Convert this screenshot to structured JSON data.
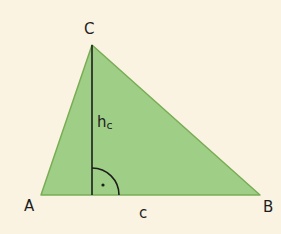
{
  "colors": {
    "background": "#fbf3e2",
    "triangle_fill": "#9fcf86",
    "triangle_stroke": "#79ad55",
    "line": "#1e1e1e"
  },
  "vertices": {
    "A": {
      "label": "A",
      "x": 41,
      "y": 195
    },
    "B": {
      "label": "B",
      "x": 260,
      "y": 195
    },
    "C": {
      "label": "C",
      "x": 92,
      "y": 45
    }
  },
  "altitude": {
    "label_main": "h",
    "label_sub": "c",
    "foot": {
      "x": 92,
      "y": 195
    }
  },
  "side_label": "c",
  "right_angle": {
    "radius": 27,
    "dot": "·"
  }
}
